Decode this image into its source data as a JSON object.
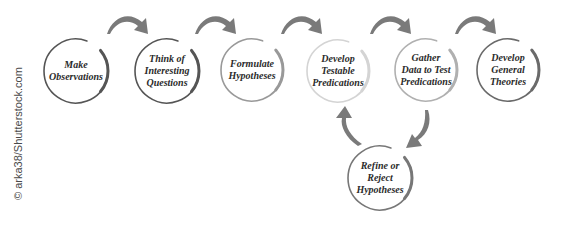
{
  "diagram": {
    "nodes": [
      {
        "id": "make-observations",
        "lines": [
          "Make",
          "Observations"
        ],
        "cx": 76,
        "cy": 71,
        "r": 32,
        "stroke": "#555555"
      },
      {
        "id": "think-questions",
        "lines": [
          "Think of",
          "Interesting",
          "Questions"
        ],
        "cx": 167,
        "cy": 71,
        "r": 32,
        "stroke": "#555555"
      },
      {
        "id": "formulate-hypotheses",
        "lines": [
          "Formulate",
          "Hypotheses"
        ],
        "cx": 252,
        "cy": 70,
        "r": 31,
        "stroke": "#999999"
      },
      {
        "id": "develop-testable-predications",
        "lines": [
          "Develop",
          "Testable",
          "Predications"
        ],
        "cx": 338,
        "cy": 71,
        "r": 31,
        "stroke": "#d4d4d4"
      },
      {
        "id": "gather-data",
        "lines": [
          "Gather",
          "Data to Test",
          "Predications"
        ],
        "cx": 426,
        "cy": 70,
        "r": 31,
        "stroke": "#b0b0b0"
      },
      {
        "id": "develop-general-theories",
        "lines": [
          "Develop",
          "General",
          "Theories"
        ],
        "cx": 508,
        "cy": 70,
        "r": 31,
        "stroke": "#6a6a6a"
      },
      {
        "id": "refine-reject-hypotheses",
        "lines": [
          "Refine or",
          "Reject",
          "Hypotheses"
        ],
        "cx": 380,
        "cy": 178,
        "r": 32,
        "stroke": "#777777"
      }
    ],
    "edges": [
      {
        "from": "make-observations",
        "to": "think-questions"
      },
      {
        "from": "think-questions",
        "to": "formulate-hypotheses"
      },
      {
        "from": "formulate-hypotheses",
        "to": "develop-testable-predications"
      },
      {
        "from": "develop-testable-predications",
        "to": "gather-data"
      },
      {
        "from": "gather-data",
        "to": "develop-general-theories"
      },
      {
        "from": "gather-data",
        "to": "refine-reject-hypotheses"
      },
      {
        "from": "refine-reject-hypotheses",
        "to": "develop-testable-predications"
      }
    ],
    "colors": {
      "arrow": "#7a7a7a",
      "text": "#2b2b2b"
    }
  },
  "credit": "© arka38/Shutterstock.com"
}
